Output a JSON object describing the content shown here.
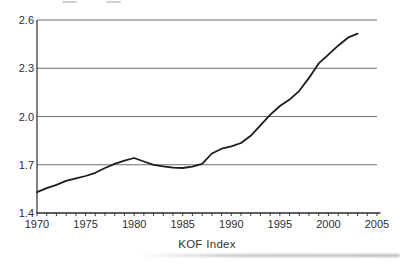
{
  "chart_data": {
    "type": "line",
    "title": "",
    "xlabel": "KOF Index",
    "ylabel": "",
    "x": [
      1970,
      1971,
      1972,
      1973,
      1974,
      1975,
      1976,
      1977,
      1978,
      1979,
      1980,
      1981,
      1982,
      1983,
      1984,
      1985,
      1986,
      1987,
      1988,
      1989,
      1990,
      1991,
      1992,
      1993,
      1994,
      1995,
      1996,
      1997,
      1998,
      1999,
      2000,
      2001,
      2002,
      2003
    ],
    "series": [
      {
        "name": "KOF Index",
        "values": [
          1.53,
          1.555,
          1.575,
          1.6,
          1.615,
          1.63,
          1.65,
          1.68,
          1.705,
          1.725,
          1.742,
          1.72,
          1.7,
          1.69,
          1.682,
          1.68,
          1.688,
          1.705,
          1.77,
          1.8,
          1.815,
          1.835,
          1.88,
          1.945,
          2.01,
          2.065,
          2.105,
          2.16,
          2.24,
          2.33,
          2.385,
          2.44,
          2.49,
          2.515
        ]
      }
    ],
    "xlim": [
      1970,
      2005
    ],
    "ylim": [
      1.4,
      2.6
    ],
    "yticks": [
      1.4,
      1.7,
      2.0,
      2.3,
      2.6
    ],
    "ytick_labels": [
      "1.4",
      "1.7",
      "2.0",
      "2.3",
      "2.6"
    ],
    "xticks_major": [
      1970,
      1975,
      1980,
      1985,
      1990,
      1995,
      2000,
      2005
    ],
    "xtick_labels": [
      "1970",
      "1975",
      "1980",
      "1985",
      "1990",
      "1995",
      "2000",
      "2005"
    ],
    "xticks_minor_every": 1,
    "grid": "horizontal",
    "legend": "none",
    "colors": {
      "line": "#1c1c1c",
      "grid": "#6f6f6f",
      "axis": "#2a2a2a",
      "text": "#2e2e2e",
      "background": "#ffffff"
    }
  }
}
